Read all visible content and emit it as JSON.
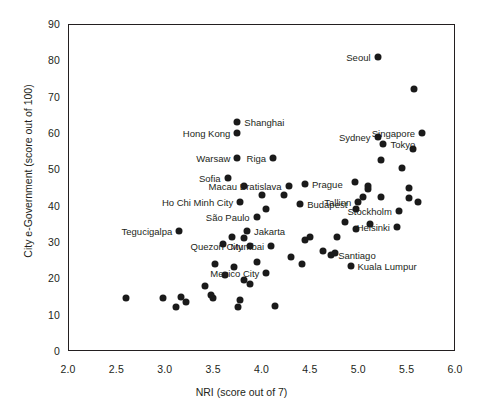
{
  "chart_data": {
    "type": "scatter",
    "title": "",
    "xlabel": "NRI (score out of 7)",
    "ylabel": "City e-Government (score out of 100)",
    "xlim": [
      2.0,
      6.0
    ],
    "ylim": [
      0,
      90
    ],
    "xticks": [
      "2.0",
      "2.5",
      "3.0",
      "3.5",
      "4.0",
      "4.5",
      "5.0",
      "5.5",
      "6.0"
    ],
    "yticks": [
      "0",
      "10",
      "20",
      "30",
      "40",
      "50",
      "60",
      "70",
      "80",
      "90"
    ],
    "grid": false,
    "legend": "none",
    "marker_color": "#1a1a1a",
    "points": [
      {
        "label": "Seoul",
        "x": 5.2,
        "y": 81.0,
        "side": "left"
      },
      {
        "label": "",
        "x": 5.58,
        "y": 72.0,
        "side": "right"
      },
      {
        "label": "Shanghai",
        "x": 3.75,
        "y": 63.0,
        "side": "right"
      },
      {
        "label": "Hong Kong",
        "x": 3.75,
        "y": 60.0,
        "side": "left"
      },
      {
        "label": "Singapore",
        "x": 5.66,
        "y": 60.0,
        "side": "left"
      },
      {
        "label": "Sydney",
        "x": 5.2,
        "y": 59.0,
        "side": "left"
      },
      {
        "label": "Tokyo",
        "x": 5.26,
        "y": 57.0,
        "side": "right"
      },
      {
        "label": "",
        "x": 5.57,
        "y": 55.5,
        "side": "right"
      },
      {
        "label": "Warsaw",
        "x": 3.75,
        "y": 53.0,
        "side": "left"
      },
      {
        "label": "Riga",
        "x": 4.12,
        "y": 53.0,
        "side": "left"
      },
      {
        "label": "",
        "x": 5.24,
        "y": 52.5,
        "side": "right"
      },
      {
        "label": "",
        "x": 5.45,
        "y": 50.5,
        "side": "right"
      },
      {
        "label": "Sofia",
        "x": 3.65,
        "y": 47.5,
        "side": "left"
      },
      {
        "label": "Macau",
        "x": 3.82,
        "y": 45.5,
        "side": "left"
      },
      {
        "label": "Bratislava",
        "x": 4.28,
        "y": 45.5,
        "side": "left"
      },
      {
        "label": "Prague",
        "x": 4.45,
        "y": 46.0,
        "side": "right"
      },
      {
        "label": "",
        "x": 4.97,
        "y": 46.5,
        "side": "right"
      },
      {
        "label": "",
        "x": 5.1,
        "y": 45.5,
        "side": "right"
      },
      {
        "label": "",
        "x": 5.1,
        "y": 44.5,
        "side": "right"
      },
      {
        "label": "",
        "x": 5.52,
        "y": 45.0,
        "side": "right"
      },
      {
        "label": "",
        "x": 4.0,
        "y": 43.0,
        "side": "right"
      },
      {
        "label": "",
        "x": 4.23,
        "y": 43.0,
        "side": "right"
      },
      {
        "label": "",
        "x": 5.05,
        "y": 42.5,
        "side": "right"
      },
      {
        "label": "",
        "x": 5.23,
        "y": 42.5,
        "side": "right"
      },
      {
        "label": "",
        "x": 5.52,
        "y": 42.0,
        "side": "right"
      },
      {
        "label": "Ho Chi Minh City",
        "x": 3.78,
        "y": 41.0,
        "side": "left"
      },
      {
        "label": "Budapest",
        "x": 4.4,
        "y": 40.5,
        "side": "right"
      },
      {
        "label": "Tallinn",
        "x": 5.0,
        "y": 41.0,
        "side": "left"
      },
      {
        "label": "",
        "x": 4.05,
        "y": 39.0,
        "side": "right"
      },
      {
        "label": "",
        "x": 4.98,
        "y": 39.0,
        "side": "right"
      },
      {
        "label": "Stockholm",
        "x": 5.42,
        "y": 38.5,
        "side": "left"
      },
      {
        "label": "São Paulo",
        "x": 3.95,
        "y": 37.0,
        "side": "left"
      },
      {
        "label": "",
        "x": 4.86,
        "y": 35.5,
        "side": "right"
      },
      {
        "label": "",
        "x": 5.12,
        "y": 35.0,
        "side": "right"
      },
      {
        "label": "Helsinki",
        "x": 5.4,
        "y": 34.0,
        "side": "left"
      },
      {
        "label": "Tegucigalpa",
        "x": 3.15,
        "y": 33.0,
        "side": "left"
      },
      {
        "label": "Jakarta",
        "x": 3.85,
        "y": 33.0,
        "side": "right"
      },
      {
        "label": "",
        "x": 4.98,
        "y": 33.5,
        "side": "right"
      },
      {
        "label": "",
        "x": 3.7,
        "y": 31.5,
        "side": "right"
      },
      {
        "label": "",
        "x": 3.82,
        "y": 31.0,
        "side": "right"
      },
      {
        "label": "",
        "x": 4.5,
        "y": 31.5,
        "side": "right"
      },
      {
        "label": "",
        "x": 4.78,
        "y": 31.5,
        "side": "right"
      },
      {
        "label": "Quezon City",
        "x": 3.88,
        "y": 29.0,
        "side": "left"
      },
      {
        "label": "Mumbai",
        "x": 4.1,
        "y": 29.0,
        "side": "left"
      },
      {
        "label": "",
        "x": 3.6,
        "y": 29.5,
        "side": "right"
      },
      {
        "label": "",
        "x": 4.64,
        "y": 27.5,
        "side": "right"
      },
      {
        "label": "Santiago",
        "x": 4.72,
        "y": 26.5,
        "side": "right"
      },
      {
        "label": "",
        "x": 4.76,
        "y": 27.0,
        "side": "right"
      },
      {
        "label": "",
        "x": 4.3,
        "y": 26.0,
        "side": "right"
      },
      {
        "label": "",
        "x": 4.42,
        "y": 24.0,
        "side": "right"
      },
      {
        "label": "",
        "x": 3.52,
        "y": 24.0,
        "side": "right"
      },
      {
        "label": "",
        "x": 3.95,
        "y": 24.5,
        "side": "right"
      },
      {
        "label": "Kuala Lumpur",
        "x": 4.92,
        "y": 23.5,
        "side": "right"
      },
      {
        "label": "",
        "x": 3.72,
        "y": 23.0,
        "side": "right"
      },
      {
        "label": "",
        "x": 3.62,
        "y": 21.0,
        "side": "right"
      },
      {
        "label": "Mexico City",
        "x": 4.05,
        "y": 21.5,
        "side": "left"
      },
      {
        "label": "",
        "x": 3.82,
        "y": 19.5,
        "side": "right"
      },
      {
        "label": "",
        "x": 3.88,
        "y": 18.5,
        "side": "right"
      },
      {
        "label": "",
        "x": 2.6,
        "y": 14.5,
        "side": "right"
      },
      {
        "label": "",
        "x": 2.98,
        "y": 14.5,
        "side": "right"
      },
      {
        "label": "",
        "x": 3.17,
        "y": 15.0,
        "side": "right"
      },
      {
        "label": "",
        "x": 3.12,
        "y": 12.0,
        "side": "right"
      },
      {
        "label": "",
        "x": 3.22,
        "y": 13.5,
        "side": "right"
      },
      {
        "label": "",
        "x": 3.5,
        "y": 14.5,
        "side": "right"
      },
      {
        "label": "",
        "x": 3.48,
        "y": 15.5,
        "side": "right"
      },
      {
        "label": "",
        "x": 3.78,
        "y": 14.0,
        "side": "right"
      },
      {
        "label": "",
        "x": 3.76,
        "y": 12.0,
        "side": "right"
      },
      {
        "label": "",
        "x": 4.14,
        "y": 12.5,
        "side": "right"
      },
      {
        "label": "",
        "x": 3.42,
        "y": 18.0,
        "side": "right"
      },
      {
        "label": "",
        "x": 4.45,
        "y": 30.5,
        "side": "right"
      },
      {
        "label": "",
        "x": 5.62,
        "y": 41.0,
        "side": "right"
      }
    ]
  }
}
